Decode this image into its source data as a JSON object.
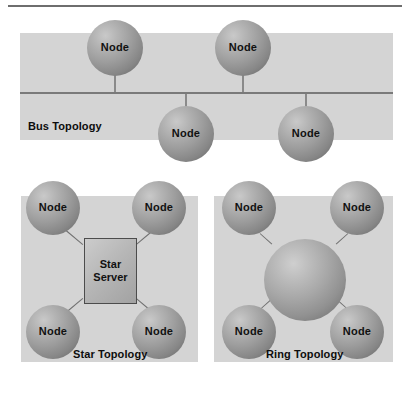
{
  "figure": {
    "background_color": "#ffffff",
    "panel_color": "#d4d4d4",
    "sphere_color": "#9d9d9d",
    "line_color": "#7a7a7a",
    "text_color": "#111111"
  },
  "bus": {
    "caption": "Bus Topology",
    "nodes": [
      {
        "label": "Node",
        "position": "top-left"
      },
      {
        "label": "Node",
        "position": "top-right"
      },
      {
        "label": "Node",
        "position": "bottom-left"
      },
      {
        "label": "Node",
        "position": "bottom-right"
      }
    ]
  },
  "star": {
    "caption": "Star Topology",
    "server": {
      "label": "Star\nServer"
    },
    "nodes": [
      {
        "label": "Node",
        "position": "top-left"
      },
      {
        "label": "Node",
        "position": "top-right"
      },
      {
        "label": "Node",
        "position": "bottom-left"
      },
      {
        "label": "Node",
        "position": "bottom-right"
      }
    ]
  },
  "ring": {
    "caption": "Ring Topology",
    "hub": {
      "label": ""
    },
    "nodes": [
      {
        "label": "Node",
        "position": "top-left"
      },
      {
        "label": "Node",
        "position": "top-right"
      },
      {
        "label": "Node",
        "position": "bottom-left"
      },
      {
        "label": "Node",
        "position": "bottom-right"
      }
    ]
  }
}
